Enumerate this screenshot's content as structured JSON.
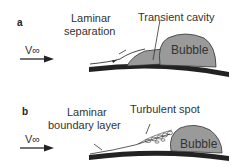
{
  "panels": [
    {
      "letter": "a",
      "velocity_label": "V∞",
      "labels": {
        "left": [
          "Laminar",
          "separation"
        ],
        "top": "Transient cavity",
        "bubble": "Bubble"
      }
    },
    {
      "letter": "b",
      "velocity_label": "V∞",
      "labels": {
        "left": [
          "Laminar",
          "boundary layer"
        ],
        "top": "Turbulent spot",
        "bubble": "Bubble"
      }
    }
  ],
  "colors": {
    "surface": "#222222",
    "bubble_fill": "#9a9a9a",
    "bubble_stroke": "#333333",
    "text": "#333333"
  }
}
